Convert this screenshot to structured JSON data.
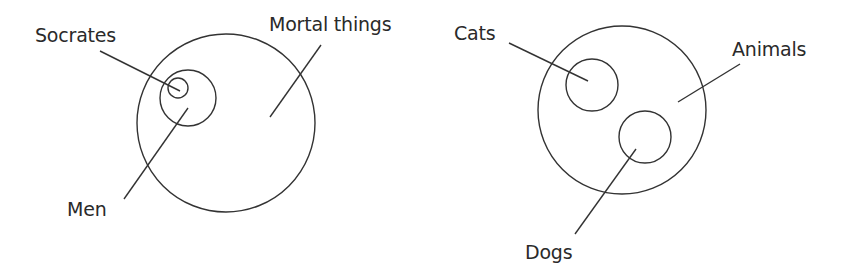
{
  "diagrams": [
    {
      "id": "socrates-syllogism",
      "sets": [
        {
          "label": "Mortal things",
          "cx": 226,
          "cy": 123,
          "r": 89
        },
        {
          "label": "Men",
          "cx": 188,
          "cy": 98,
          "r": 28
        },
        {
          "label": "Socrates",
          "cx": 178,
          "cy": 88,
          "r": 10
        }
      ],
      "labels": {
        "socrates": {
          "text": "Socrates",
          "x": 35,
          "y": 26
        },
        "men": {
          "text": "Men",
          "x": 67,
          "y": 200
        },
        "mortal": {
          "text": "Mortal things",
          "x": 269,
          "y": 15
        }
      },
      "leaders": [
        {
          "from": [
            100,
            51
          ],
          "to": [
            180,
            91
          ]
        },
        {
          "from": [
            124,
            199
          ],
          "to": [
            188,
            108
          ]
        },
        {
          "from": [
            321,
            45
          ],
          "to": [
            270,
            117
          ]
        }
      ]
    },
    {
      "id": "animals-cats-dogs",
      "sets": [
        {
          "label": "Animals",
          "cx": 622,
          "cy": 110,
          "r": 84
        },
        {
          "label": "Cats",
          "cx": 592,
          "cy": 85,
          "r": 26
        },
        {
          "label": "Dogs",
          "cx": 645,
          "cy": 137,
          "r": 26
        }
      ],
      "labels": {
        "cats": {
          "text": "Cats",
          "x": 454,
          "y": 24
        },
        "animals": {
          "text": "Animals",
          "x": 732,
          "y": 40
        },
        "dogs": {
          "text": "Dogs",
          "x": 525,
          "y": 243
        }
      },
      "leaders": [
        {
          "from": [
            509,
            43
          ],
          "to": [
            588,
            81
          ]
        },
        {
          "from": [
            740,
            64
          ],
          "to": [
            678,
            102
          ]
        },
        {
          "from": [
            575,
            234
          ],
          "to": [
            636,
            149
          ]
        }
      ]
    }
  ],
  "colors": {
    "stroke": "#333333",
    "text": "#2a2a2a",
    "background": "#ffffff"
  }
}
